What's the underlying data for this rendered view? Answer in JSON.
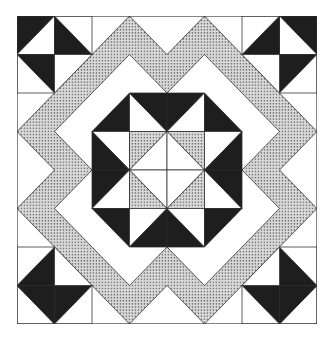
{
  "grid_units": 8,
  "colors": {
    "background": "#ffffff",
    "dark": "#1e1e1e",
    "light": "#ffffff",
    "dotted_fill": "#cfcfcf",
    "dot": "#6a6a6a",
    "line": "#2a2a2a"
  },
  "regions": {
    "corner_blocks": [
      "top-left",
      "top-right",
      "bottom-left",
      "bottom-right"
    ],
    "zigzag_band": "dotted diamond-zigzag band",
    "center": "octagon star with dotted inner squares"
  }
}
